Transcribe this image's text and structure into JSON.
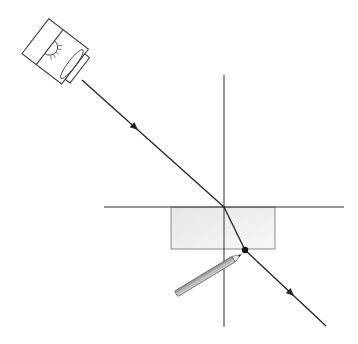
{
  "diagram": {
    "colors": {
      "background": "#ffffff",
      "line": "#222222",
      "block_fill": "#efefef",
      "block_stroke": "#888888",
      "pencil_body": "#bdbdbd",
      "pencil_stroke": "#555555",
      "dot": "#111111"
    },
    "elements": {
      "ray_box": {
        "label": "ray-box-light-source"
      },
      "incident_ray": {
        "from": [
          82,
          80
        ],
        "to": [
          224,
          207
        ],
        "arrow_at": [
          136,
          128
        ]
      },
      "refracted_ray": {
        "from": [
          224,
          207
        ],
        "to": [
          245,
          250
        ]
      },
      "emergent_ray": {
        "from": [
          245,
          250
        ],
        "to": [
          326,
          326
        ],
        "arrow_at": [
          292,
          293
        ]
      },
      "normal_vertical": {
        "x": 224,
        "y1": 75,
        "y2": 327
      },
      "surface_horizontal": {
        "y": 207,
        "x1": 104,
        "x2": 344
      },
      "glass_block": {
        "x": 171,
        "y": 207,
        "width": 104,
        "height": 42
      },
      "exit_dot": {
        "cx": 245,
        "cy": 250,
        "r": 3
      },
      "pencil": {
        "tail": [
          176,
          294
        ],
        "tip": [
          242,
          254
        ]
      }
    }
  }
}
